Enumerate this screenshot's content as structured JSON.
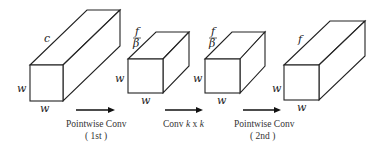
{
  "diagram": {
    "tensors": [
      {
        "id": "input",
        "depth_label": "c",
        "height_label": "w",
        "width_label": "w"
      },
      {
        "id": "after-pw1",
        "depth_label_num": "f",
        "depth_label_den": "β",
        "height_label": "w",
        "width_label": "w"
      },
      {
        "id": "after-conv",
        "depth_label_num": "f",
        "depth_label_den": "β",
        "height_label": "w",
        "width_label": "w"
      },
      {
        "id": "output",
        "depth_label": "f",
        "height_label": "w",
        "width_label": "w"
      }
    ],
    "operations": [
      {
        "id": "pw1",
        "line1": "Pointwise Conv",
        "line2": "( 1st )"
      },
      {
        "id": "conv",
        "prefix": "Conv ",
        "k1": "k",
        "mid": " x ",
        "k2": "k"
      },
      {
        "id": "pw2",
        "line1": "Pointwise Conv",
        "line2": "( 2nd )"
      }
    ]
  }
}
